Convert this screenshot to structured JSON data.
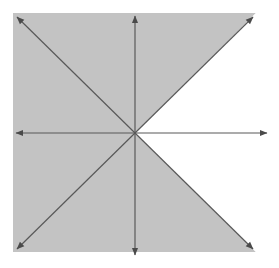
{
  "figure": {
    "title": "",
    "width": 279,
    "height": 268,
    "background_color": "#ffffff",
    "shaded_region_color": "#c3c3c3",
    "line_color": "#595959",
    "line_width": 1.2
  },
  "chart_data": {
    "type": "line",
    "title": "",
    "subtitle": "",
    "xlabel": "",
    "ylabel": "",
    "xlim": [
      -1.05,
      1.05
    ],
    "ylim": [
      -1.05,
      1.05
    ],
    "grid": false,
    "legend": "none",
    "annotations": [],
    "tick_labels": {
      "x": [],
      "y": []
    },
    "origin": {
      "x_px": 135,
      "y_px": 133
    },
    "plot_area_px": {
      "left": 13,
      "top": 13,
      "right": 256,
      "bottom": 252
    },
    "series": [
      {
        "name": "x-axis",
        "kind": "axis",
        "arrow": "both",
        "x": [
          -1.05,
          1.05
        ],
        "y": [
          0,
          0
        ]
      },
      {
        "name": "y-axis",
        "kind": "axis",
        "arrow": "both",
        "x": [
          0,
          0
        ],
        "y": [
          -1.05,
          1.05
        ]
      },
      {
        "name": "y = x",
        "kind": "line",
        "arrow": "both",
        "slope": 1,
        "intercept": 0,
        "x": [
          -1,
          1
        ],
        "y": [
          -1,
          1
        ]
      },
      {
        "name": "y = -x",
        "kind": "line",
        "arrow": "both",
        "slope": -1,
        "intercept": 0,
        "x": [
          -1,
          1
        ],
        "y": [
          1,
          -1
        ]
      }
    ],
    "shaded_regions": [
      {
        "name": "region-left-wedge",
        "fill": "#c3c3c3",
        "description": "Left wedge between the diagonals, including left half of square"
      },
      {
        "name": "region-top-wedge",
        "fill": "#c3c3c3",
        "description": "Top wedge above both diagonals"
      },
      {
        "name": "region-bottom-wedge",
        "fill": "#c3c3c3",
        "description": "Bottom wedge below both diagonals"
      },
      {
        "name": "region-right-wedge",
        "fill": "#ffffff",
        "description": "Right wedge between the diagonals is unshaded (white)"
      }
    ]
  }
}
